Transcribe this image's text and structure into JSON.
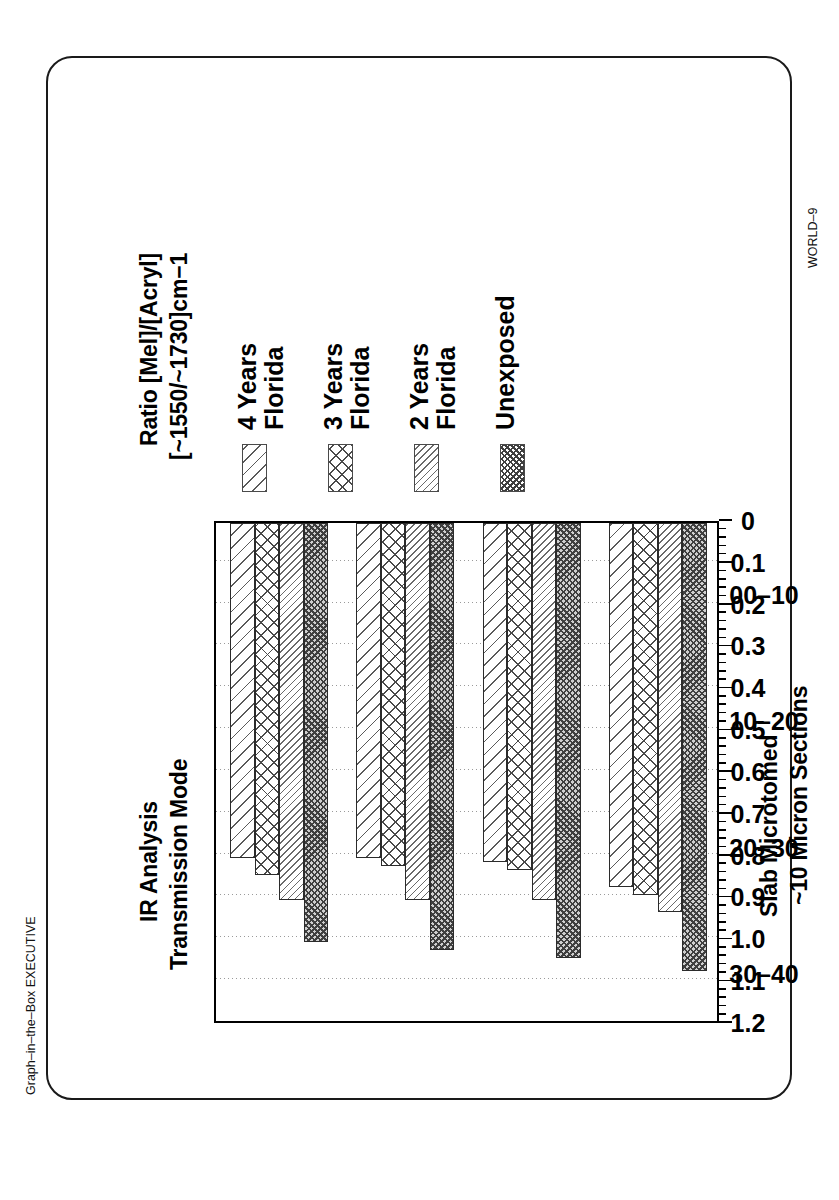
{
  "chart_data": {
    "type": "bar",
    "orientation": "horizontal",
    "title": "IR Analysis\nTransmission Mode",
    "title_lines": [
      "IR Analysis",
      "Transmission Mode"
    ],
    "value_axis_label_lines": [
      "Ratio [Mel]/[Acryl]",
      "[~1550/~1730]cm−1"
    ],
    "category_axis_label_lines": [
      "Slab Microtomed",
      "~10 Micron Sections"
    ],
    "xlabel": "Slab Microtomed ~10 Micron Sections",
    "ylabel": "Ratio [Mel]/[Acryl] [~1550/~1730]cm−1",
    "categories": [
      "00–10",
      "10–20",
      "20–30",
      "30–40"
    ],
    "value_axis_ticks": [
      "1.2",
      "1.1",
      "1.0",
      "0.9",
      "0.8",
      "0.7",
      "0.6",
      "0.5",
      "0.4",
      "0.3",
      "0.2",
      "0.1",
      "0"
    ],
    "value_axis_tick_values": [
      1.2,
      1.1,
      1.0,
      0.9,
      0.8,
      0.7,
      0.6,
      0.5,
      0.4,
      0.3,
      0.2,
      0.1,
      0
    ],
    "ylim": [
      0,
      1.2
    ],
    "minor_ticks_per_interval": 5,
    "grid": true,
    "grid_style": "dotted-vertical",
    "legend_position": "right-of-plot",
    "series": [
      {
        "name": "4 Years Florida",
        "name_lines": [
          "4 Years",
          "Florida"
        ],
        "pattern": "diagonal-wide",
        "values": [
          0.88,
          0.82,
          0.81,
          0.81
        ]
      },
      {
        "name": "3 Years Florida",
        "name_lines": [
          "3 Years",
          "Florida"
        ],
        "pattern": "crosshatch-diamond",
        "values": [
          0.9,
          0.84,
          0.83,
          0.85
        ]
      },
      {
        "name": "2 Years Florida",
        "name_lines": [
          "2 Years",
          "Florida"
        ],
        "pattern": "diagonal-tight",
        "values": [
          0.94,
          0.91,
          0.91,
          0.91
        ]
      },
      {
        "name": "Unexposed",
        "name_lines": [
          "Unexposed"
        ],
        "pattern": "checker-dense",
        "values": [
          1.08,
          1.05,
          1.03,
          1.01
        ]
      }
    ]
  },
  "legend": {
    "items": [
      {
        "label_line1": "4 Years",
        "label_line2": "Florida"
      },
      {
        "label_line1": "3 Years",
        "label_line2": "Florida"
      },
      {
        "label_line1": "2 Years",
        "label_line2": "Florida"
      },
      {
        "label_line1": "Unexposed",
        "label_line2": ""
      }
    ]
  },
  "titles": {
    "line1": "IR Analysis",
    "line2": "Transmission Mode",
    "value_axis_line1": "Ratio [Mel]/[Acryl]",
    "value_axis_line2": "[~1550/~1730]cm−1",
    "category_axis_line1": "Slab Microtomed",
    "category_axis_line2": "~10 Micron Sections"
  },
  "footnotes": {
    "left": "Graph–in–the–Box EXECUTIVE",
    "right": "WORLD–9"
  },
  "colors": {
    "frame": "#1a1a1a",
    "bar_outline": "#2b2b2b",
    "hatch": "#4a4a4a",
    "grid": "#9a9a9a",
    "background": "#ffffff"
  }
}
